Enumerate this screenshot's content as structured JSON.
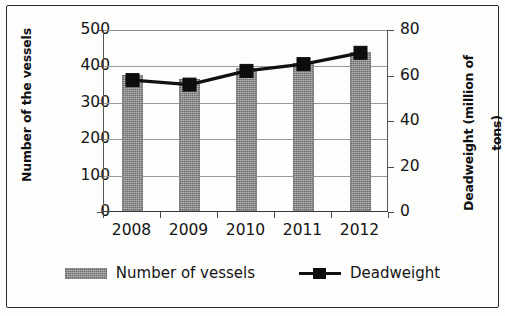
{
  "chart_data": {
    "type": "bar",
    "title": "",
    "subtitle": "",
    "xlabel": "",
    "categories": [
      "2008",
      "2009",
      "2010",
      "2011",
      "2012"
    ],
    "series": [
      {
        "name": "Number of vessels",
        "type": "bar",
        "axis": "left",
        "values": [
          373,
          363,
          393,
          408,
          436
        ],
        "color": "#8c8c8c"
      },
      {
        "name": "Deadweight",
        "type": "line",
        "axis": "right",
        "values": [
          58,
          56,
          62,
          65,
          70
        ],
        "color": "#111111",
        "marker": "square"
      }
    ],
    "axes": {
      "left": {
        "label": "Number of the vessels",
        "ticks": [
          "0",
          "100",
          "200",
          "300",
          "400",
          "500"
        ],
        "tick_values": [
          0,
          100,
          200,
          300,
          400,
          500
        ],
        "ylim": [
          0,
          500
        ]
      },
      "right": {
        "label": "Deadweight (million of tons)",
        "label_line1": "Deadweight (million of",
        "label_line2": "tons)",
        "ticks": [
          "0",
          "20",
          "40",
          "60",
          "80"
        ],
        "tick_values": [
          0,
          20,
          40,
          60,
          80
        ],
        "ylim": [
          0,
          80
        ]
      }
    },
    "grid": true,
    "legend_position": "bottom",
    "legend": [
      {
        "label": "Number of vessels",
        "swatch": "bar-swatch"
      },
      {
        "label": "Deadweight",
        "swatch": "line-marker-swatch"
      }
    ]
  }
}
